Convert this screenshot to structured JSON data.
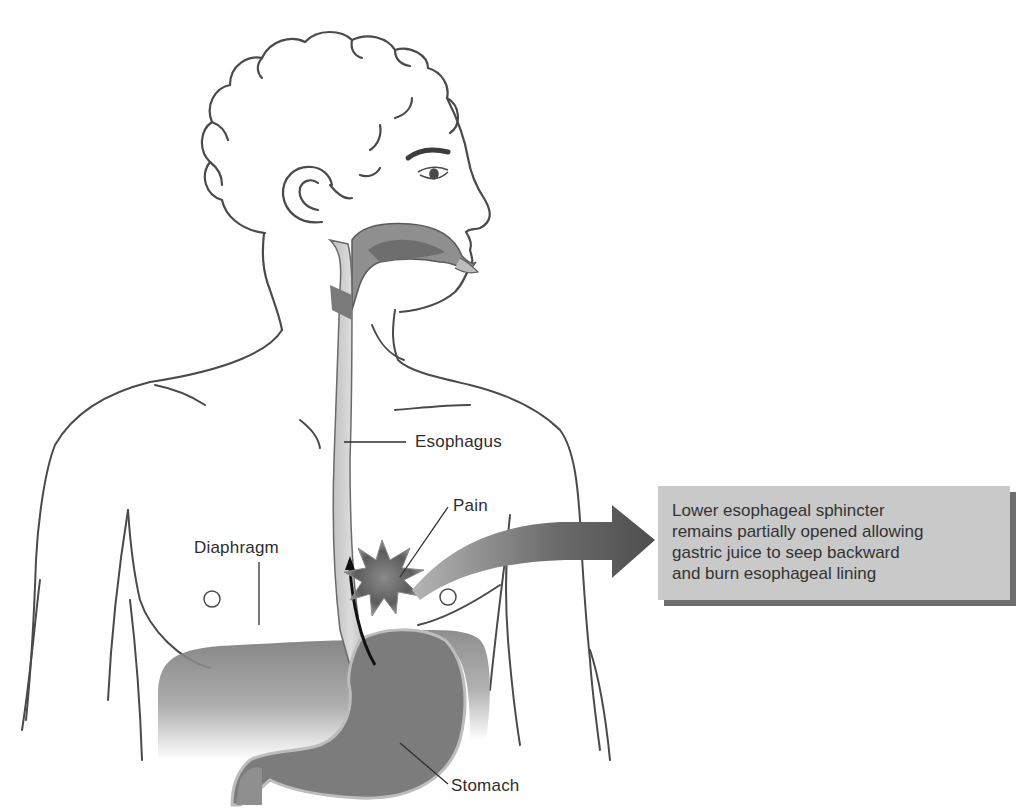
{
  "diagram": {
    "labels": {
      "esophagus": "Esophagus",
      "pain": "Pain",
      "diaphragm": "Diaphragm",
      "stomach": "Stomach"
    },
    "callout": {
      "lines": [
        "Lower esophageal sphincter",
        "remains partially opened allowing",
        "gastric juice to seep backward",
        "and burn esophageal lining"
      ]
    },
    "colors": {
      "line": "#4a4a4a",
      "organ_dark": "#6f6f6f",
      "organ_mid": "#9a9a9a",
      "esophagus_fill": "#cfcfcf",
      "callout_bg": "#c9c9c9",
      "callout_shadow": "#6e6e6e",
      "arrow": "#5a5a5a"
    }
  }
}
